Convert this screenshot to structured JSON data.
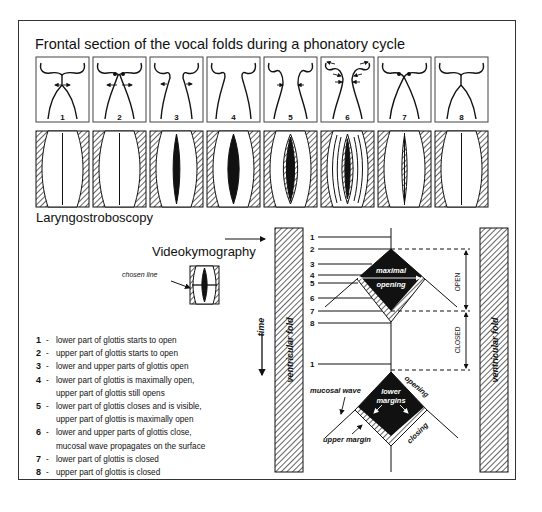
{
  "title": "Frontal section of the vocal folds during a phonatory cycle",
  "stroboscopy_label": "Laryngostroboscopy",
  "kymography_label": "Videokymography",
  "chosen_line_label": "chosen line",
  "frontal_stages": [
    "1",
    "2",
    "3",
    "4",
    "5",
    "6",
    "7",
    "8"
  ],
  "kymogram": {
    "time_label": "time",
    "left_fold_label": "ventricular fold",
    "right_fold_label": "ventricular fold",
    "row_numbers": [
      "1",
      "2",
      "3",
      "4",
      "5",
      "6",
      "7",
      "8",
      "1"
    ],
    "maximal_opening_label_1": "maximal",
    "maximal_opening_label_2": "opening",
    "open_label": "OPEN",
    "closed_label": "CLOSED",
    "mucosal_wave_label": "mucosal wave",
    "lower_margins_label_1": "lower",
    "lower_margins_label_2": "margins",
    "upper_margin_label": "upper margin",
    "opening_label": "opening",
    "closing_label": "closing"
  },
  "legend": [
    {
      "num": "1",
      "text": "lower part of glottis starts to open"
    },
    {
      "num": "2",
      "text": "upper part of glottis starts to open"
    },
    {
      "num": "3",
      "text": "lower and upper parts of glottis open"
    },
    {
      "num": "4",
      "text": "lower part of glottis is maximally open,\nupper part of glottis still opens"
    },
    {
      "num": "5",
      "text": "lower part of glottis closes and is visible,\nupper part of glottis is maximally open"
    },
    {
      "num": "6",
      "text": "lower and upper parts of glottis close,\nmucosal wave propagates on the surface"
    },
    {
      "num": "7",
      "text": "lower part of glottis is closed"
    },
    {
      "num": "8",
      "text": "upper part of glottis is closed"
    }
  ]
}
